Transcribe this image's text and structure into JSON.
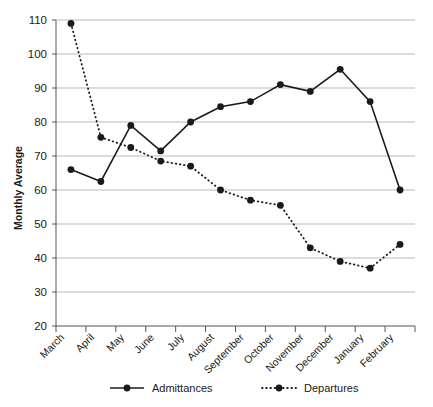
{
  "chart_data": {
    "type": "line",
    "title": "",
    "xlabel": "",
    "ylabel": "Monthly Average",
    "ylim": [
      20,
      110
    ],
    "ytick_step": 10,
    "yticks": [
      "110",
      "100",
      "90",
      "80",
      "70",
      "60",
      "50",
      "40",
      "30",
      "20"
    ],
    "grid": true,
    "grid_axis": "y",
    "legend_position": "bottom",
    "categories": [
      "March",
      "April",
      "May",
      "June",
      "July",
      "August",
      "September",
      "October",
      "November",
      "December",
      "January",
      "February"
    ],
    "series": [
      {
        "name": "Admittances",
        "style": "solid",
        "marker": "circle",
        "color": "#1a1a1a",
        "values": [
          66,
          62.5,
          79,
          71.5,
          80,
          84.5,
          86,
          91,
          89,
          95.5,
          86,
          60
        ]
      },
      {
        "name": "Departures",
        "style": "dotted",
        "marker": "circle",
        "color": "#1a1a1a",
        "values": [
          109,
          75.5,
          72.5,
          68.5,
          67,
          60,
          57,
          55.5,
          43,
          39,
          37,
          44
        ]
      }
    ]
  },
  "legend": {
    "items": [
      {
        "label": "Admittances",
        "style": "solid"
      },
      {
        "label": "Departures",
        "style": "dotted"
      }
    ]
  },
  "colors": {
    "ink": "#1a1a1a",
    "grid": "#b9b9b9",
    "axis": "#555555",
    "background": "#ffffff"
  }
}
